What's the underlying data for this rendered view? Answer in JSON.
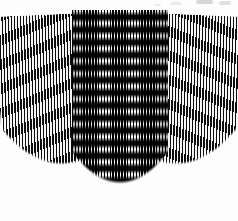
{
  "image": {
    "title": "Moire interference pattern on overlapping striped sheets",
    "subject": "three-striped-paper-sheets",
    "medium": "grayscale-scan",
    "background_color": "#fdfdfd",
    "width": 238,
    "height": 221
  },
  "palette": {
    "ink": "#0c0c0c",
    "paper": "#f7f7f7",
    "pure_black": "#000000",
    "pure_white": "#ffffff",
    "smudge_gray": "#c9c9c9"
  },
  "sheets": [
    {
      "id": "left",
      "label": "Left striped sheet",
      "pattern": "vertical-line-grating",
      "stripe_period_px": 3.05,
      "stripe_duty": 0.48,
      "rotation_deg": -2.4,
      "edge_shape": "convex-curved"
    },
    {
      "id": "center",
      "label": "Center striped sheet (overlay)",
      "pattern": "vertical-line-grating-with-moire",
      "stripe_period_px": 2.9,
      "stripe_duty": 0.52,
      "rotation_deg": 0,
      "moire_band_period_px": 12.6,
      "moire_band_orientation": "horizontal",
      "edge_shape": "convex-curved"
    },
    {
      "id": "right",
      "label": "Right striped sheet",
      "pattern": "vertical-line-grating",
      "stripe_period_px": 3.05,
      "stripe_duty": 0.48,
      "rotation_deg": 2.4,
      "edge_shape": "convex-curved"
    }
  ],
  "artifacts": [
    {
      "id": "a",
      "label": "scan smudge"
    },
    {
      "id": "b",
      "label": "scan smudge"
    },
    {
      "id": "c",
      "label": "scan smudge"
    },
    {
      "id": "d",
      "label": "scan smudge"
    }
  ]
}
